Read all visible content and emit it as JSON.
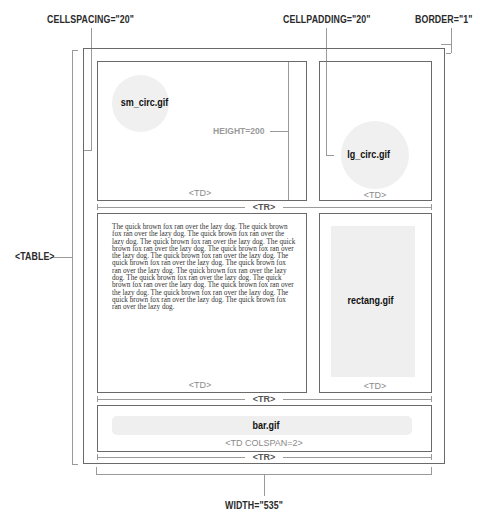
{
  "annotations": {
    "cellspacing": "CELLSPACING=\"20\"",
    "cellpadding": "CELLPADDING=\"20\"",
    "border": "BORDER=\"1\"",
    "table": "<TABLE>",
    "height": "HEIGHT=200",
    "width": "WIDTH=\"535\""
  },
  "rows": [
    {
      "tr_label": "<TR>",
      "cells": [
        {
          "image_label": "sm_circ.gif",
          "td_label": "<TD>"
        },
        {
          "image_label": "lg_circ.gif",
          "td_label": "<TD>"
        }
      ]
    },
    {
      "tr_label": "<TR>",
      "cells": [
        {
          "td_label": "<TD>",
          "text_lines": [
            "The quick brown fox ran over the lazy dog.  The quick brown",
            "fox ran over the lazy dog.  The quick brown fox ran over the",
            "lazy dog.  The quick brown fox ran over the lazy dog.  The quick",
            "brown fox ran over the lazy dog.  The quick brown fox ran over",
            "the lazy dog.  The quick brown fox ran over the lazy dog.  The",
            "quick brown fox ran over the lazy dog.  The quick brown fox",
            "ran over the lazy dog.  The quick brown fox ran over the lazy",
            "dog.  The quick brown fox ran over the lazy dog.  The quick",
            "brown fox ran over the lazy dog.  The quick brown fox ran over",
            "the lazy dog.  The quick brown fox ran over the lazy dog.  The",
            "quick brown fox ran over the lazy dog.  The quick brown fox",
            "ran over the lazy dog."
          ]
        },
        {
          "image_label": "rectang.gif",
          "td_label": "<TD>"
        }
      ]
    },
    {
      "tr_label": "<TR>",
      "cells": [
        {
          "image_label": "bar.gif",
          "td_label": "<TD COLSPAN=2>"
        }
      ]
    }
  ]
}
